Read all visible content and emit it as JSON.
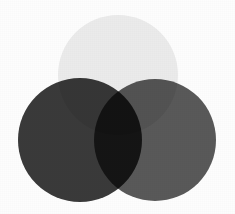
{
  "figure": {
    "kind": "three-circle-venn-diagram",
    "background_color": "#fdfdfd",
    "width": 235,
    "height": 214,
    "blend_mode": "multiply",
    "title": "",
    "caption": ""
  },
  "circles": [
    {
      "id": "top",
      "name": "top-circle",
      "label": "",
      "fill": "#ededed",
      "cx": 118,
      "cy": 75,
      "r": 60
    },
    {
      "id": "left",
      "name": "left-circle",
      "label": "",
      "fill": "#3a3a3a",
      "cx": 80,
      "cy": 140,
      "r": 62
    },
    {
      "id": "right",
      "name": "right-circle",
      "label": "",
      "fill": "#5a5a5a",
      "cx": 155,
      "cy": 140,
      "r": 61
    }
  ],
  "regions": [
    {
      "id": "top-only",
      "label": "",
      "observed_color": "#ededed"
    },
    {
      "id": "left-only",
      "label": "",
      "observed_color": "#3a3a3a"
    },
    {
      "id": "right-only",
      "label": "",
      "observed_color": "#585858"
    },
    {
      "id": "top-left",
      "label": "",
      "observed_color": "#353535"
    },
    {
      "id": "top-right",
      "label": "",
      "observed_color": "#535353"
    },
    {
      "id": "left-right",
      "label": "",
      "observed_color": "#1b1b1b"
    },
    {
      "id": "top-left-right",
      "label": "",
      "observed_color": "#101010"
    }
  ]
}
